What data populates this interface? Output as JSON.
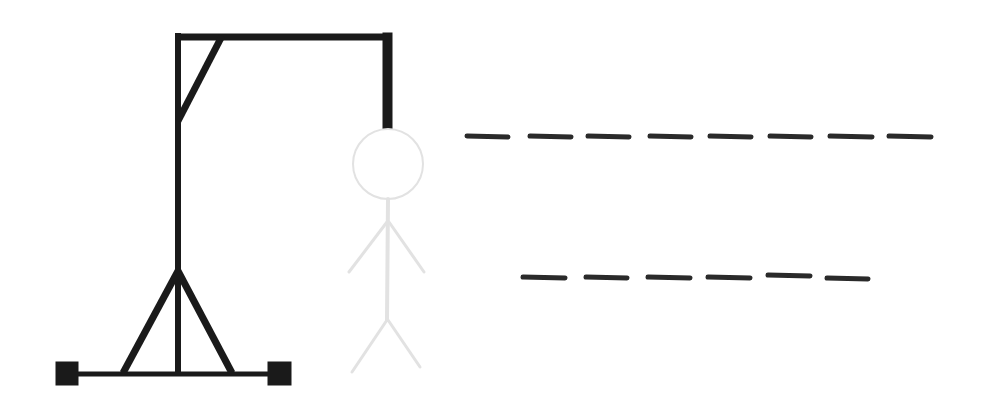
{
  "game": {
    "name": "Hangman",
    "wrong_guesses_shown": 0,
    "figure_state": "ghost-outline"
  },
  "colors": {
    "background": "#ffffff",
    "gallows": "#1a1a1a",
    "figure": "#e2e2e2",
    "blanks": "#2a2a2a"
  },
  "word_rows": [
    {
      "length": 8,
      "letters": [
        "",
        "",
        "",
        "",
        "",
        "",
        "",
        ""
      ]
    },
    {
      "length": 6,
      "letters": [
        "",
        "",
        "",
        "",
        "",
        ""
      ]
    }
  ],
  "icons": {
    "gallows": "gallows-icon",
    "figure": "stick-figure-icon"
  }
}
